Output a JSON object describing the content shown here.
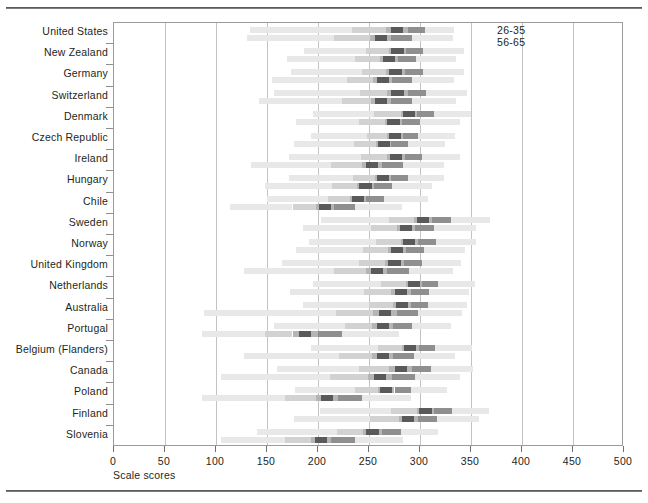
{
  "chart_data": {
    "type": "bar",
    "title": "",
    "xlabel": "Scale scores",
    "ylabel": "",
    "xlim": [
      0,
      500
    ],
    "xticks": [
      0,
      50,
      100,
      150,
      200,
      250,
      300,
      350,
      400,
      450,
      500
    ],
    "xticklabels": [
      "0",
      "50",
      "100",
      "150",
      "200",
      "250",
      "300",
      "350",
      "400",
      "450",
      "500"
    ],
    "grid": true,
    "legend_position": "top-right",
    "legend": [
      "26-35",
      "56-65"
    ],
    "series_note": "Each country shows two horizontal percentile-range bars: upper bar = age 26-35, lower bar = age 56-65. Segments encode 5th, 25th, median band, 75th and 95th percentiles.",
    "categories": [
      "United States",
      "New Zealand",
      "Germany",
      "Switzerland",
      "Denmark",
      "Czech Republic",
      "Ireland",
      "Hungary",
      "Chile",
      "Sweden",
      "Norway",
      "United Kingdom",
      "Netherlands",
      "Australia",
      "Portugal",
      "Belgium (Flanders)",
      "Canada",
      "Poland",
      "Finland",
      "Slovenia"
    ],
    "series": [
      {
        "name": "26-35",
        "rows": [
          {
            "category": "United States",
            "p5": 133,
            "p25": 233,
            "median_lo": 267,
            "median_hi": 288,
            "p75": 305,
            "p95": 333
          },
          {
            "category": "New Zealand",
            "p5": 186,
            "p25": 247,
            "median_lo": 270,
            "median_hi": 286,
            "p75": 303,
            "p95": 343
          },
          {
            "category": "Germany",
            "p5": 174,
            "p25": 243,
            "median_lo": 267,
            "median_hi": 285,
            "p75": 303,
            "p95": 343
          },
          {
            "category": "Switzerland",
            "p5": 157,
            "p25": 241,
            "median_lo": 268,
            "median_hi": 288,
            "p75": 306,
            "p95": 346
          },
          {
            "category": "Denmark",
            "p5": 195,
            "p25": 255,
            "median_lo": 281,
            "median_hi": 297,
            "p75": 314,
            "p95": 350
          },
          {
            "category": "Czech Republic",
            "p5": 193,
            "p25": 248,
            "median_lo": 268,
            "median_hi": 283,
            "p75": 298,
            "p95": 334
          },
          {
            "category": "Ireland",
            "p5": 172,
            "p25": 242,
            "median_lo": 268,
            "median_hi": 285,
            "p75": 302,
            "p95": 339
          },
          {
            "category": "Hungary",
            "p5": 172,
            "p25": 234,
            "median_lo": 256,
            "median_hi": 272,
            "p75": 288,
            "p95": 324
          },
          {
            "category": "Chile",
            "p5": 150,
            "p25": 210,
            "median_lo": 231,
            "median_hi": 247,
            "p75": 265,
            "p95": 308
          },
          {
            "category": "Sweden",
            "p5": 203,
            "p25": 270,
            "median_lo": 294,
            "median_hi": 312,
            "p75": 330,
            "p95": 369
          },
          {
            "category": "Norway",
            "p5": 191,
            "p25": 257,
            "median_lo": 281,
            "median_hi": 298,
            "p75": 316,
            "p95": 355
          },
          {
            "category": "United Kingdom",
            "p5": 165,
            "p25": 240,
            "median_lo": 266,
            "median_hi": 284,
            "p75": 302,
            "p95": 340
          },
          {
            "category": "Netherlands",
            "p5": 195,
            "p25": 262,
            "median_lo": 286,
            "median_hi": 302,
            "p75": 318,
            "p95": 354
          },
          {
            "category": "Australia",
            "p5": 185,
            "p25": 250,
            "median_lo": 274,
            "median_hi": 291,
            "p75": 308,
            "p95": 346
          },
          {
            "category": "Portugal",
            "p5": 157,
            "p25": 226,
            "median_lo": 253,
            "median_hi": 274,
            "p75": 292,
            "p95": 330
          },
          {
            "category": "Belgium (Flanders)",
            "p5": 193,
            "p25": 259,
            "median_lo": 282,
            "median_hi": 299,
            "p75": 315,
            "p95": 351
          },
          {
            "category": "Canada",
            "p5": 160,
            "p25": 240,
            "median_lo": 270,
            "median_hi": 292,
            "p75": 311,
            "p95": 352
          },
          {
            "category": "Poland",
            "p5": 177,
            "p25": 236,
            "median_lo": 259,
            "median_hi": 275,
            "p75": 291,
            "p95": 326
          },
          {
            "category": "Finland",
            "p5": 202,
            "p25": 272,
            "median_lo": 297,
            "median_hi": 314,
            "p75": 331,
            "p95": 368
          },
          {
            "category": "Slovenia",
            "p5": 140,
            "p25": 219,
            "median_lo": 244,
            "median_hi": 263,
            "p75": 281,
            "p95": 318
          }
        ]
      },
      {
        "name": "56-65",
        "rows": [
          {
            "category": "United States",
            "p5": 130,
            "p25": 216,
            "median_lo": 251,
            "median_hi": 272,
            "p75": 292,
            "p95": 332
          },
          {
            "category": "New Zealand",
            "p5": 170,
            "p25": 236,
            "median_lo": 261,
            "median_hi": 278,
            "p75": 296,
            "p95": 335
          },
          {
            "category": "Germany",
            "p5": 155,
            "p25": 228,
            "median_lo": 254,
            "median_hi": 273,
            "p75": 292,
            "p95": 333
          },
          {
            "category": "Switzerland",
            "p5": 142,
            "p25": 224,
            "median_lo": 252,
            "median_hi": 272,
            "p75": 292,
            "p95": 335
          },
          {
            "category": "Denmark",
            "p5": 178,
            "p25": 240,
            "median_lo": 266,
            "median_hi": 282,
            "p75": 300,
            "p95": 339
          },
          {
            "category": "Czech Republic",
            "p5": 176,
            "p25": 235,
            "median_lo": 257,
            "median_hi": 272,
            "p75": 288,
            "p95": 325
          },
          {
            "category": "Ireland",
            "p5": 134,
            "p25": 213,
            "median_lo": 243,
            "median_hi": 263,
            "p75": 283,
            "p95": 324
          },
          {
            "category": "Hungary",
            "p5": 148,
            "p25": 214,
            "median_lo": 238,
            "median_hi": 255,
            "p75": 273,
            "p95": 312
          },
          {
            "category": "Chile",
            "p5": 114,
            "p25": 175,
            "median_lo": 198,
            "median_hi": 216,
            "p75": 236,
            "p95": 282
          },
          {
            "category": "Sweden",
            "p5": 185,
            "p25": 252,
            "median_lo": 277,
            "median_hi": 295,
            "p75": 314,
            "p95": 355
          },
          {
            "category": "Norway",
            "p5": 178,
            "p25": 244,
            "median_lo": 269,
            "median_hi": 286,
            "p75": 304,
            "p95": 344
          },
          {
            "category": "United Kingdom",
            "p5": 127,
            "p25": 216,
            "median_lo": 247,
            "median_hi": 268,
            "p75": 289,
            "p95": 332
          },
          {
            "category": "Netherlands",
            "p5": 173,
            "p25": 245,
            "median_lo": 272,
            "median_hi": 291,
            "p75": 309,
            "p95": 348
          },
          {
            "category": "Australia",
            "p5": 88,
            "p25": 218,
            "median_lo": 254,
            "median_hi": 277,
            "p75": 298,
            "p95": 341
          },
          {
            "category": "Portugal",
            "p5": 86,
            "p25": 148,
            "median_lo": 175,
            "median_hi": 200,
            "p75": 224,
            "p95": 279
          },
          {
            "category": "Belgium (Flanders)",
            "p5": 127,
            "p25": 221,
            "median_lo": 253,
            "median_hi": 274,
            "p75": 294,
            "p95": 334
          },
          {
            "category": "Canada",
            "p5": 105,
            "p25": 212,
            "median_lo": 249,
            "median_hi": 273,
            "p75": 295,
            "p95": 339
          },
          {
            "category": "Poland",
            "p5": 86,
            "p25": 168,
            "median_lo": 198,
            "median_hi": 220,
            "p75": 243,
            "p95": 291
          },
          {
            "category": "Finland",
            "p5": 176,
            "p25": 251,
            "median_lo": 279,
            "median_hi": 298,
            "p75": 317,
            "p95": 358
          },
          {
            "category": "Slovenia",
            "p5": 105,
            "p25": 168,
            "median_lo": 193,
            "median_hi": 213,
            "p75": 236,
            "p95": 283
          }
        ]
      }
    ],
    "colors": {
      "outer_band": "#e8e8e8",
      "mid_band": "#d2d2d2",
      "inner_band": "#b5b5b5",
      "core_band": "#8f8f8f",
      "dark_marker": "#5a5a5a",
      "gridline": "#c3c3c3",
      "frame": "#9b9b9b",
      "text": "#231f20"
    }
  }
}
